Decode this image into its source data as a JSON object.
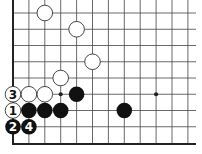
{
  "diagram": {
    "type": "go-board-diagram",
    "grid": {
      "cols": 12,
      "rows": 9,
      "origin_x": 13,
      "origin_y": 13,
      "spacing_x": 15.9,
      "spacing_y": 16.25,
      "extend_right_to": 196,
      "edges": [
        "left",
        "bottom"
      ]
    },
    "star_points": [
      {
        "col": 3,
        "row": 5
      },
      {
        "col": 9,
        "row": 5
      }
    ],
    "stones": [
      {
        "col": 2,
        "row": 0,
        "color": "white",
        "label": ""
      },
      {
        "col": 4,
        "row": 1,
        "color": "white",
        "label": ""
      },
      {
        "col": 5,
        "row": 3,
        "color": "white",
        "label": ""
      },
      {
        "col": 3,
        "row": 4,
        "color": "white",
        "label": ""
      },
      {
        "col": 0,
        "row": 5,
        "color": "white",
        "label": "3"
      },
      {
        "col": 1,
        "row": 5,
        "color": "white",
        "label": ""
      },
      {
        "col": 2,
        "row": 5,
        "color": "white",
        "label": ""
      },
      {
        "col": 4,
        "row": 5,
        "color": "black",
        "label": ""
      },
      {
        "col": 0,
        "row": 6,
        "color": "white",
        "label": "1"
      },
      {
        "col": 1,
        "row": 6,
        "color": "black",
        "label": ""
      },
      {
        "col": 2,
        "row": 6,
        "color": "black",
        "label": ""
      },
      {
        "col": 3,
        "row": 6,
        "color": "black",
        "label": ""
      },
      {
        "col": 7,
        "row": 6,
        "color": "black",
        "label": ""
      },
      {
        "col": 0,
        "row": 7,
        "color": "black",
        "label": "2"
      },
      {
        "col": 1,
        "row": 7,
        "color": "black",
        "label": "4"
      }
    ],
    "colors": {
      "line": "#444444",
      "edge": "#222222",
      "black_stone": "#111111",
      "white_stone_fill": "#ffffff",
      "white_stone_stroke": "#333333",
      "label_on_white": "#111111",
      "label_on_black": "#ffffff"
    }
  }
}
